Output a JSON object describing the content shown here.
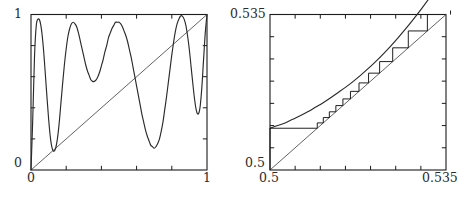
{
  "figure": {
    "title": "",
    "panels": [
      {
        "id": "left",
        "name": "full-map-panel",
        "xlabels": {
          "min": "0",
          "max": "1"
        },
        "ylabels": {
          "min": "0",
          "max": "1"
        }
      },
      {
        "id": "right",
        "name": "zoomed-cobweb-panel",
        "xlabels": {
          "min": "0.5",
          "max": "0.535"
        },
        "ylabels": {
          "min": "0.5",
          "max": "0.535"
        }
      }
    ]
  },
  "chart_data": [
    {
      "type": "line",
      "name": "iterated-map-full-range",
      "title": "",
      "xlabel": "",
      "ylabel": "",
      "xlim": [
        0,
        1
      ],
      "ylim": [
        0,
        1
      ],
      "xticks": [
        0,
        0.2,
        0.4,
        0.6,
        0.8,
        1
      ],
      "yticks": [
        0,
        0.2,
        0.4,
        0.6,
        0.8,
        1
      ],
      "xticklabels": [
        "0",
        "",
        "",
        "",
        "",
        "1"
      ],
      "yticklabels": [
        "0",
        "",
        "",
        "",
        "",
        "1"
      ],
      "grid": false,
      "legend": "none",
      "series": [
        {
          "name": "map-f(x)",
          "description": "oscillatory unimodal-repeated map with four maxima and three interior minima",
          "x": [
            0,
            0.01,
            0.02,
            0.03,
            0.04,
            0.05,
            0.06,
            0.07,
            0.08,
            0.09,
            0.1,
            0.11,
            0.12,
            0.13,
            0.14,
            0.15,
            0.16,
            0.17,
            0.18,
            0.19,
            0.2,
            0.21,
            0.22,
            0.23,
            0.24,
            0.25,
            0.26,
            0.27,
            0.28,
            0.29,
            0.3,
            0.31,
            0.32,
            0.33,
            0.34,
            0.35,
            0.36,
            0.37,
            0.38,
            0.39,
            0.4,
            0.41,
            0.42,
            0.43,
            0.44,
            0.45,
            0.46,
            0.47,
            0.48,
            0.49,
            0.5,
            0.51,
            0.52,
            0.53,
            0.54,
            0.55,
            0.56,
            0.57,
            0.58,
            0.59,
            0.6,
            0.61,
            0.62,
            0.63,
            0.64,
            0.65,
            0.66,
            0.67,
            0.68,
            0.69,
            0.7,
            0.71,
            0.72,
            0.73,
            0.74,
            0.75,
            0.76,
            0.77,
            0.78,
            0.79,
            0.8,
            0.81,
            0.82,
            0.83,
            0.84,
            0.85,
            0.86,
            0.87,
            0.88,
            0.89,
            0.9,
            0.91,
            0.92,
            0.93,
            0.94,
            0.95,
            0.96,
            0.97,
            0.98,
            0.99,
            1
          ],
          "y": [
            0.0,
            0.33,
            0.73,
            0.93,
            0.97,
            0.96,
            0.9,
            0.79,
            0.64,
            0.48,
            0.33,
            0.21,
            0.14,
            0.12,
            0.14,
            0.2,
            0.3,
            0.43,
            0.56,
            0.68,
            0.78,
            0.86,
            0.91,
            0.94,
            0.95,
            0.94,
            0.92,
            0.88,
            0.83,
            0.78,
            0.73,
            0.68,
            0.64,
            0.61,
            0.58,
            0.57,
            0.57,
            0.58,
            0.6,
            0.63,
            0.67,
            0.71,
            0.76,
            0.8,
            0.85,
            0.88,
            0.91,
            0.93,
            0.95,
            0.95,
            0.95,
            0.94,
            0.92,
            0.89,
            0.86,
            0.82,
            0.77,
            0.72,
            0.66,
            0.6,
            0.54,
            0.48,
            0.42,
            0.36,
            0.31,
            0.26,
            0.22,
            0.19,
            0.16,
            0.15,
            0.14,
            0.15,
            0.17,
            0.2,
            0.25,
            0.31,
            0.39,
            0.47,
            0.56,
            0.65,
            0.74,
            0.82,
            0.89,
            0.94,
            0.97,
            0.99,
            0.99,
            0.97,
            0.93,
            0.86,
            0.77,
            0.66,
            0.55,
            0.45,
            0.38,
            0.36,
            0.4,
            0.52,
            0.7,
            0.88,
            1.0
          ]
        },
        {
          "name": "identity-line-y-equals-x",
          "x": [
            0,
            1
          ],
          "y": [
            0,
            1
          ]
        }
      ]
    },
    {
      "type": "line",
      "name": "cobweb-near-tangency",
      "title": "",
      "xlabel": "",
      "ylabel": "",
      "xlim": [
        0.5,
        0.535
      ],
      "ylim": [
        0.5,
        0.535
      ],
      "xticks": [
        0.5,
        0.505,
        0.51,
        0.515,
        0.52,
        0.525,
        0.53,
        0.535
      ],
      "yticks": [
        0.5,
        0.505,
        0.51,
        0.515,
        0.52,
        0.525,
        0.53,
        0.535
      ],
      "xticklabels": [
        "0.5",
        "",
        "",
        "",
        "",
        "",
        "",
        "0.535"
      ],
      "yticklabels": [
        "0.5",
        "",
        "",
        "",
        "",
        "",
        "",
        "0.535"
      ],
      "grid": false,
      "legend": "none",
      "series": [
        {
          "name": "map-f(x)-zoom",
          "description": "gently curved graph passing just above the diagonal, tangent-like near the middle",
          "x": [
            0.5,
            0.5015,
            0.503,
            0.5045,
            0.506,
            0.5075,
            0.509,
            0.5105,
            0.512,
            0.5135,
            0.515,
            0.5165,
            0.518,
            0.5195,
            0.521,
            0.5225,
            0.524,
            0.5255,
            0.527,
            0.5285,
            0.53,
            0.5315,
            0.533,
            0.5345,
            0.535
          ],
          "y": [
            0.5094,
            0.51,
            0.5106,
            0.5114,
            0.5122,
            0.5131,
            0.5141,
            0.5151,
            0.5162,
            0.5174,
            0.5186,
            0.5199,
            0.5213,
            0.5228,
            0.5244,
            0.5261,
            0.5279,
            0.5298,
            0.5318,
            0.5339,
            0.5361,
            0.5384,
            0.5408,
            0.5433,
            0.5446
          ]
        },
        {
          "name": "identity-line-y-equals-x-zoom",
          "x": [
            0.5,
            0.535
          ],
          "y": [
            0.5,
            0.535
          ]
        },
        {
          "name": "cobweb-orbit",
          "description": "staircase orbit starting at x=0.5, steps tiny near tangency then growing and escaping upward",
          "x_orbit": [
            0.5,
            0.5094,
            0.5106,
            0.5118,
            0.5131,
            0.5145,
            0.516,
            0.5177,
            0.5196,
            0.5218,
            0.5244,
            0.5275,
            0.5313,
            0.5359
          ]
        }
      ]
    }
  ]
}
